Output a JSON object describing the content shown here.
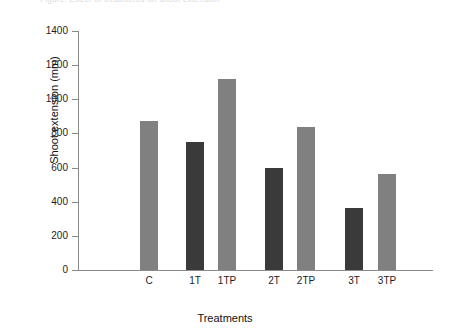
{
  "caption": {
    "text": "Figure: Effect of treatments on shoot extension"
  },
  "chart_data": {
    "type": "bar",
    "title": "",
    "xlabel": "Treatments",
    "ylabel": "Shoot extension (mm)",
    "categories": [
      "C",
      "1T",
      "1TP",
      "2T",
      "2TP",
      "3T",
      "3TP"
    ],
    "values": [
      870,
      750,
      1120,
      595,
      840,
      365,
      565
    ],
    "bar_colors": [
      "#808080",
      "#3a3a3a",
      "#808080",
      "#3a3a3a",
      "#808080",
      "#3a3a3a",
      "#808080"
    ],
    "ylim": [
      0,
      1400
    ],
    "yticks": [
      0,
      200,
      400,
      600,
      800,
      1000,
      1200,
      1400
    ],
    "ytick_labels": [
      "0",
      "200",
      "400",
      "600",
      "800",
      "1000",
      "1200",
      "1400"
    ],
    "grid": false,
    "legend": null,
    "bar_positions_px": [
      140,
      186,
      218,
      265,
      297,
      345,
      378
    ],
    "bar_width_px": 18
  },
  "colors": {
    "light_bar": "#808080",
    "dark_bar": "#3a3a3a",
    "axis": "#8a8a8a",
    "text": "#1a1a1a",
    "background": "#ffffff"
  }
}
